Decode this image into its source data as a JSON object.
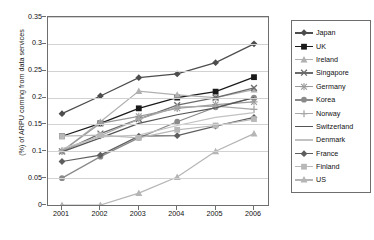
{
  "chart_data": {
    "type": "line",
    "title": "",
    "xlabel": "",
    "ylabel": "(%) of ARPU coming from data services",
    "categories": [
      "2001",
      "2002",
      "2003",
      "2004",
      "2005",
      "2006"
    ],
    "x": [
      2001,
      2002,
      2003,
      2004,
      2005,
      2006
    ],
    "ylim": [
      0,
      0.35
    ],
    "yticks": [
      "0",
      "0.05",
      "0.1",
      "0.15",
      "0.2",
      "0.25",
      "0.3",
      "0.35"
    ],
    "ytick_values": [
      0,
      0.05,
      0.1,
      0.15,
      0.2,
      0.25,
      0.3,
      0.35
    ],
    "grid": true,
    "legend_position": "right",
    "series": [
      {
        "name": "Japan",
        "color": "#4d4d4d",
        "marker": "diamond",
        "values": [
          0.17,
          0.203,
          0.237,
          0.244,
          0.265,
          0.3
        ]
      },
      {
        "name": "UK",
        "color": "#1a1a1a",
        "marker": "square",
        "values": [
          0.128,
          0.152,
          0.18,
          0.2,
          0.211,
          0.238
        ]
      },
      {
        "name": "Ireland",
        "color": "#b0b0b0",
        "marker": "triangle",
        "values": [
          0.1,
          0.155,
          0.212,
          0.205,
          0.2,
          0.215
        ]
      },
      {
        "name": "Singapore",
        "color": "#6b6b6b",
        "marker": "cross",
        "values": [
          0.1,
          0.133,
          0.16,
          0.186,
          0.2,
          0.218
        ]
      },
      {
        "name": "Germany",
        "color": "#9a9a9a",
        "marker": "star",
        "values": [
          0.1,
          0.152,
          0.165,
          0.18,
          0.187,
          0.192
        ]
      },
      {
        "name": "Korea",
        "color": "#8a8a8a",
        "marker": "circle",
        "values": [
          0.05,
          0.09,
          0.125,
          0.155,
          0.182,
          0.2
        ]
      },
      {
        "name": "Norway",
        "color": "#a8a8a8",
        "marker": "plus",
        "values": [
          0.101,
          0.129,
          0.16,
          0.182,
          0.184,
          0.178
        ]
      },
      {
        "name": "Switzerland",
        "color": "#555555",
        "marker": "none",
        "values": [
          0.099,
          0.125,
          0.152,
          0.168,
          0.181,
          0.2
        ]
      },
      {
        "name": "Denmark",
        "color": "#c2c2c2",
        "marker": "none",
        "values": [
          0.105,
          0.127,
          0.13,
          0.148,
          0.163,
          0.172
        ]
      },
      {
        "name": "France",
        "color": "#5e5e5e",
        "marker": "diamond",
        "values": [
          0.081,
          0.093,
          0.128,
          0.129,
          0.147,
          0.163
        ]
      },
      {
        "name": "Finland",
        "color": "#b8b8b8",
        "marker": "square",
        "values": [
          0.128,
          0.13,
          0.125,
          0.14,
          0.148,
          0.16
        ]
      },
      {
        "name": "US",
        "color": "#b5b5b5",
        "marker": "triangle",
        "values": [
          0.0,
          0.0,
          0.022,
          0.052,
          0.1,
          0.133
        ]
      }
    ]
  },
  "axis": {
    "y_title": "(%) of ARPU coming from data services"
  }
}
